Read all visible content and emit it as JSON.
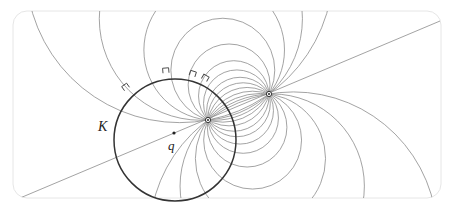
{
  "figure": {
    "width": 449,
    "height": 213,
    "frame": {
      "x": 13,
      "y": 11,
      "w": 428,
      "h": 187,
      "rx": 14,
      "stroke": "#e6e6e6"
    },
    "colors": {
      "circle_K": "#333333",
      "pencil_circles": "#8c8c8c",
      "line": "#8c8c8c",
      "marks": "#444444",
      "points": "#222222"
    },
    "labels": {
      "circle": "K",
      "point": "q"
    },
    "circle_K": {
      "cx": 175,
      "cy": 140,
      "r": 61
    },
    "point_q": {
      "x": 174,
      "y": 133
    },
    "pole_inner": {
      "x": 208,
      "y": 120
    },
    "pole_outer": {
      "x": 269,
      "y": 94
    },
    "line": {
      "x1": 20,
      "y1": 198,
      "x2": 440,
      "y2": 21
    },
    "label_positions": {
      "K": {
        "x": 98,
        "y": 131
      },
      "q": {
        "x": 168,
        "y": 150
      }
    },
    "pencil_t_values": [
      -150,
      -96,
      -62,
      -40,
      -24,
      -12,
      -4,
      4,
      12,
      22,
      36,
      56,
      86,
      140
    ],
    "right_angle_marks": [
      {
        "x": 127,
        "y": 89,
        "angle": -35
      },
      {
        "x": 166,
        "y": 73,
        "angle": -5
      },
      {
        "x": 192,
        "y": 76,
        "angle": 18
      },
      {
        "x": 204,
        "y": 80,
        "angle": 30
      }
    ]
  }
}
